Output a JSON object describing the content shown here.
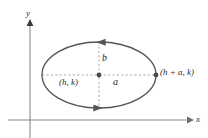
{
  "figure": {
    "background_color": "#ffffff",
    "width": 208,
    "height": 138
  },
  "axes": {
    "color": "#8a8a8a",
    "x_axis": {
      "label": "x",
      "y_position": 120,
      "x_start": 8,
      "x_end": 192,
      "arrow": "right"
    },
    "y_axis": {
      "label": "y",
      "x_position": 30,
      "y_start": 138,
      "y_end": 22,
      "arrow": "up"
    }
  },
  "ellipse": {
    "stroke_color": "#55555a",
    "center_x": 99,
    "center_y": 75,
    "radius_x": 57,
    "radius_y": 33,
    "direction_arrows": [
      {
        "name": "top-arrow-left",
        "x": 100,
        "y": 42,
        "points": "left"
      },
      {
        "name": "bottom-arrow-right",
        "x": 99,
        "y": 108,
        "points": "right"
      }
    ]
  },
  "guides": {
    "dash_color": "#b2a5a8",
    "major_axis": {
      "x1": 42,
      "y1": 75,
      "x2": 156,
      "y2": 75
    },
    "minor_axis": {
      "x1": 99,
      "y1": 42,
      "x2": 99,
      "y2": 108
    }
  },
  "points": [
    {
      "name": "center-point",
      "x": 99,
      "y": 75,
      "color": "#4a4a4f"
    },
    {
      "name": "vertex-point",
      "x": 156,
      "y": 75,
      "color": "#4a4a4f"
    }
  ],
  "labels": {
    "y_axis": {
      "text": "y",
      "x": 26,
      "y": 9
    },
    "x_axis": {
      "text": "x",
      "x": 196,
      "y": 115
    },
    "semi_minor": {
      "text": "b",
      "x": 102,
      "y": 53
    },
    "semi_major": {
      "text": "a",
      "x": 113,
      "y": 77
    },
    "center": {
      "text": "(h, k)",
      "x": 59,
      "y": 78
    },
    "vertex": {
      "text": "(h + a, k)",
      "x": 160,
      "y": 68
    }
  }
}
